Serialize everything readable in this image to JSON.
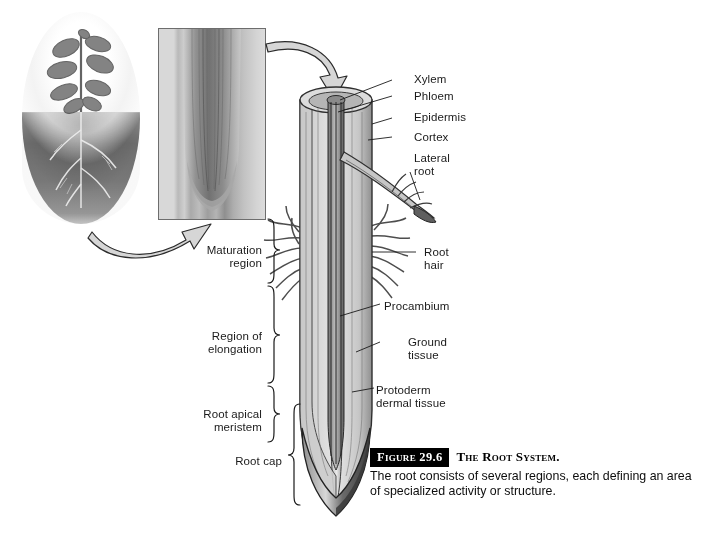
{
  "figure": {
    "number_label": "Figure 29.6",
    "title": "The Root System.",
    "body": "The root consists of several regions, each defining an area of specialized activity or structure."
  },
  "right_labels": [
    {
      "id": "xylem",
      "text": "Xylem"
    },
    {
      "id": "phloem",
      "text": "Phloem"
    },
    {
      "id": "epidermis",
      "text": "Epidermis"
    },
    {
      "id": "cortex",
      "text": "Cortex"
    },
    {
      "id": "lateral-root",
      "text": "Lateral\nroot"
    },
    {
      "id": "root-hair",
      "text": "Root\nhair"
    },
    {
      "id": "procambium",
      "text": "Procambium"
    },
    {
      "id": "ground-tissue",
      "text": "Ground\ntissue"
    },
    {
      "id": "protoderm",
      "text": "Protoderm\ndermal tissue"
    }
  ],
  "left_regions": [
    {
      "id": "maturation-region",
      "text": "Maturation\nregion"
    },
    {
      "id": "region-of-elongation",
      "text": "Region of\nelongation"
    },
    {
      "id": "root-apical-meristem",
      "text": "Root apical\nmeristem"
    },
    {
      "id": "root-cap",
      "text": "Root cap"
    }
  ],
  "images": {
    "plant_photo": "whole-plant-photo",
    "micrograph": "root-tip-micrograph"
  },
  "colors": {
    "ink": "#1a1a1a",
    "caption_box": "#000000",
    "root_light": "#e3e3e3",
    "root_mid": "#b8b8b8",
    "root_dark": "#6e6e6e"
  }
}
